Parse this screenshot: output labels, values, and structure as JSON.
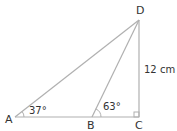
{
  "diagram": {
    "type": "geometry-triangle",
    "points": {
      "A": {
        "label": "A",
        "x": 15,
        "y": 117
      },
      "B": {
        "label": "B",
        "x": 92,
        "y": 117
      },
      "C": {
        "label": "C",
        "x": 139,
        "y": 117
      },
      "D": {
        "label": "D",
        "x": 139,
        "y": 20
      }
    },
    "segments": [
      "AD",
      "BD",
      "DC",
      "AC"
    ],
    "angles": {
      "A": "37°",
      "B": "63°",
      "C": "right-angle"
    },
    "side_labels": {
      "DC": "12 cm"
    },
    "line_color": "#b0b0b0",
    "text_color": "#333333"
  }
}
